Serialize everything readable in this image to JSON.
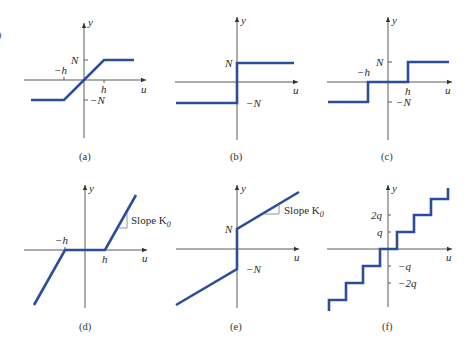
{
  "figure": {
    "edge_fragment": "0",
    "colors": {
      "curve": "#2a4d9c",
      "axis": "#5a5a5a",
      "text": "#2a2a2a"
    },
    "axis_labels": {
      "x": "u",
      "y": "y"
    },
    "panels": [
      {
        "id": "a",
        "caption": "(a)",
        "name": "saturation",
        "labels": {
          "N": "N",
          "negN": "−N",
          "h": "h",
          "negh": "−h"
        }
      },
      {
        "id": "b",
        "caption": "(b)",
        "name": "relay",
        "labels": {
          "N": "N",
          "negN": "−N"
        }
      },
      {
        "id": "c",
        "caption": "(c)",
        "name": "relay-with-dead-zone",
        "labels": {
          "N": "N",
          "negN": "−N",
          "h": "h",
          "negh": "−h"
        }
      },
      {
        "id": "d",
        "caption": "(d)",
        "name": "dead-zone",
        "labels": {
          "h": "h",
          "negh": "−h",
          "slope": "Slope K",
          "slope_sub": "0"
        }
      },
      {
        "id": "e",
        "caption": "(e)",
        "name": "preload",
        "labels": {
          "N": "N",
          "negN": "−N",
          "slope": "Slope K",
          "slope_sub": "0"
        }
      },
      {
        "id": "f",
        "caption": "(f)",
        "name": "quantization",
        "labels": {
          "q": "q",
          "twoq": "2q",
          "negq": "−q",
          "negtwoq": "−2q"
        }
      }
    ]
  }
}
